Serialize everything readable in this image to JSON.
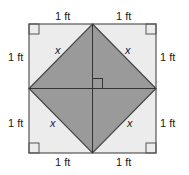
{
  "diagram": {
    "type": "geometry-figure",
    "colors": {
      "outer_fill": "#ececec",
      "inner_fill": "#9a9a9a",
      "stroke": "#555555"
    },
    "labels": {
      "top_left": "1 ft",
      "top_right": "1 ft",
      "left_top": "1 ft",
      "right_top": "1 ft",
      "left_bottom": "1 ft",
      "right_bottom": "1 ft",
      "bottom_left": "1 ft",
      "bottom_right": "1 ft",
      "x_top_left": "x",
      "x_top_right": "x",
      "x_bottom_left": "x",
      "x_bottom_right": "x"
    }
  }
}
